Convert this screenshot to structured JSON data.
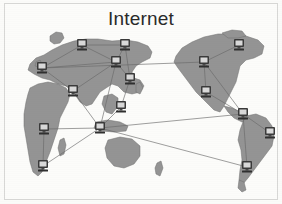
{
  "figure": {
    "title": "Internet",
    "caption_text": "Internet",
    "background_color": "#fbfbf9",
    "frame_color": "#d8d8d6",
    "land_color": "#949494",
    "land_outline_color": "#6f6f6f",
    "link_color": "#6a6a6a",
    "node_icon_name": "computer-icon",
    "node_count": 16,
    "link_count": 22
  },
  "diagram_data": {
    "type": "network-map",
    "title": "Internet",
    "description": "World map with networked computer nodes connected by links",
    "nodes": [
      {
        "id": "n1",
        "label": "node-north-europe",
        "region": "Northern Europe",
        "x": 82,
        "y": 45
      },
      {
        "id": "n2",
        "label": "node-central-asia",
        "region": "Central Asia",
        "x": 125,
        "y": 45
      },
      {
        "id": "n3",
        "label": "node-west-europe",
        "region": "Western Europe",
        "x": 42,
        "y": 68
      },
      {
        "id": "n4",
        "label": "node-east-asia",
        "region": "East Asia",
        "x": 130,
        "y": 79
      },
      {
        "id": "n5",
        "label": "node-middle-east",
        "region": "Middle East",
        "x": 73,
        "y": 91
      },
      {
        "id": "n6",
        "label": "node-south-asia",
        "region": "South Asia",
        "x": 121,
        "y": 107
      },
      {
        "id": "n7",
        "label": "node-southeast-asia",
        "region": "Southeast Asia",
        "x": 100,
        "y": 128
      },
      {
        "id": "n8",
        "label": "node-west-africa",
        "region": "West Africa",
        "x": 44,
        "y": 129
      },
      {
        "id": "n9",
        "label": "node-south-africa",
        "region": "Southern Africa",
        "x": 43,
        "y": 166
      },
      {
        "id": "n10",
        "label": "node-canada",
        "region": "Canada",
        "x": 239,
        "y": 45
      },
      {
        "id": "n11",
        "label": "node-us-northwest",
        "region": "US Northwest",
        "x": 204,
        "y": 62
      },
      {
        "id": "n12",
        "label": "node-us-southwest",
        "region": "US Southwest",
        "x": 206,
        "y": 92
      },
      {
        "id": "n13",
        "label": "node-central-america",
        "region": "Central America",
        "x": 243,
        "y": 114
      },
      {
        "id": "n14",
        "label": "node-northeast-brazil",
        "region": "Northeast Brazil",
        "x": 270,
        "y": 133
      },
      {
        "id": "n15",
        "label": "node-southeast-brazil",
        "region": "Southeast Brazil",
        "x": 247,
        "y": 167
      },
      {
        "id": "n16",
        "label": "node-north-pacific",
        "region": "North Pacific",
        "x": 116,
        "y": 62
      }
    ],
    "links": [
      {
        "from": "n1",
        "to": "n2"
      },
      {
        "from": "n1",
        "to": "n3"
      },
      {
        "from": "n1",
        "to": "n16"
      },
      {
        "from": "n2",
        "to": "n16"
      },
      {
        "from": "n2",
        "to": "n4"
      },
      {
        "from": "n3",
        "to": "n5"
      },
      {
        "from": "n3",
        "to": "n16"
      },
      {
        "from": "n16",
        "to": "n4"
      },
      {
        "from": "n16",
        "to": "n5"
      },
      {
        "from": "n16",
        "to": "n7"
      },
      {
        "from": "n4",
        "to": "n6"
      },
      {
        "from": "n5",
        "to": "n7"
      },
      {
        "from": "n6",
        "to": "n7"
      },
      {
        "from": "n7",
        "to": "n8"
      },
      {
        "from": "n7",
        "to": "n9"
      },
      {
        "from": "n7",
        "to": "n13"
      },
      {
        "from": "n7",
        "to": "n15"
      },
      {
        "from": "n8",
        "to": "n9"
      },
      {
        "from": "n10",
        "to": "n11"
      },
      {
        "from": "n11",
        "to": "n12"
      },
      {
        "from": "n11",
        "to": "n13"
      },
      {
        "from": "n12",
        "to": "n13"
      },
      {
        "from": "n13",
        "to": "n14"
      },
      {
        "from": "n13",
        "to": "n15"
      },
      {
        "from": "n3",
        "to": "n11"
      }
    ]
  }
}
